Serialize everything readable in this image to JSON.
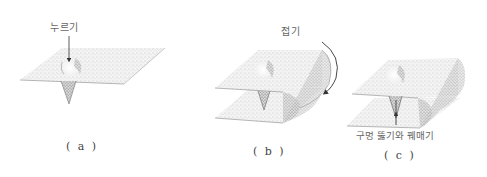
{
  "panels": [
    {
      "id": "a",
      "caption": "( a )",
      "label": "누르기"
    },
    {
      "id": "b",
      "caption": "( b )",
      "label": "접기"
    },
    {
      "id": "c",
      "caption": "( c )",
      "label": "구멍 뚫기와 꿰매기"
    }
  ],
  "colors": {
    "sheet_fill": "#efefef",
    "stipple": "#9a9a9a",
    "line": "#555555",
    "shadow": "#777777"
  }
}
